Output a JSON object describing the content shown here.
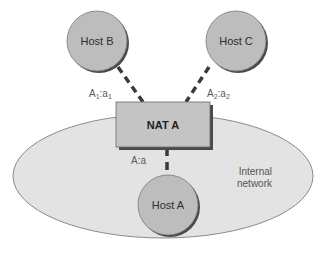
{
  "diagram": {
    "internal_network": {
      "label_line1": "Internal",
      "label_line2": "network",
      "fill": "#e3e3e3",
      "stroke": "#8a8a8a"
    },
    "nat": {
      "label": "NAT A",
      "fill": "#c4c4c4",
      "shadow": "#4a4a4a"
    },
    "hosts": [
      {
        "id": "host-b",
        "label": "Host B"
      },
      {
        "id": "host-c",
        "label": "Host C"
      },
      {
        "id": "host-a",
        "label": "Host A"
      }
    ],
    "host_fill": "#bdbdbd",
    "host_shadow": "#4a4a4a",
    "links": [
      {
        "from": "Host B",
        "to": "NAT A",
        "address": "A",
        "address_sub": "1",
        "port": "a",
        "port_sub": "1"
      },
      {
        "from": "Host C",
        "to": "NAT A",
        "address": "A",
        "address_sub": "2",
        "port": "a",
        "port_sub": "2"
      },
      {
        "from": "NAT A",
        "to": "Host A",
        "label": "A:a"
      }
    ],
    "link_color": "#3a3a3a"
  }
}
